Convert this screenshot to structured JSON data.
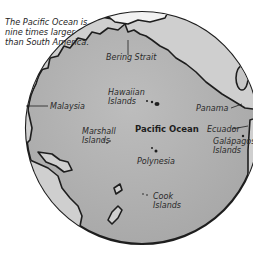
{
  "caption": "The Pacific Ocean is nine times larger than South America.",
  "map": {
    "ocean_label": "Pacific Ocean",
    "labels": {
      "bering_strait": "Bering Strait",
      "hawaiian_1": "Hawaiian",
      "hawaiian_2": "Islands",
      "panama": "Panama",
      "malaysia": "Malaysia",
      "marshall_1": "Marshall",
      "marshall_2": "Islands",
      "ecuador": "Ecuador",
      "galapagos_1": "Galápagos",
      "galapagos_2": "Islands",
      "polynesia": "Polynesia",
      "cook_1": "Cook",
      "cook_2": "Islands"
    },
    "colors": {
      "ocean": "#b4b4b4",
      "land": "#cfcfcf",
      "outline": "#1e1e1e",
      "background": "#ffffff"
    }
  }
}
